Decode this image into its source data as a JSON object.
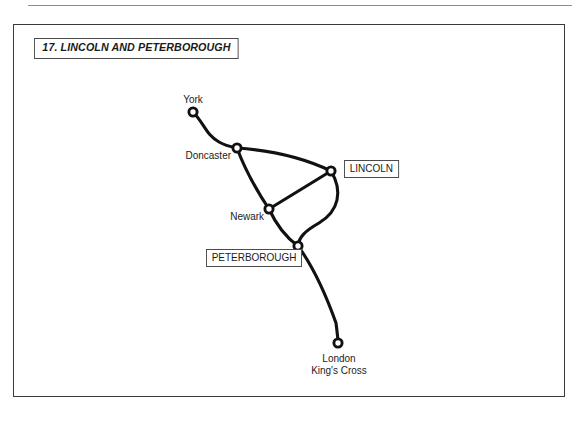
{
  "page": {
    "background_color": "#ffffff",
    "top_rule_color": "#8d8d8d"
  },
  "frame": {
    "border_color": "#3a3a3a",
    "title": "17. LINCOLN AND PETERBOROUGH"
  },
  "map": {
    "line_color": "#111111",
    "station_fill": "#ffffff",
    "stations": [
      {
        "id": "york",
        "label": "York",
        "x": 179,
        "y": 87,
        "highlighted": false
      },
      {
        "id": "doncaster",
        "label": "Doncaster",
        "x": 223,
        "y": 123,
        "highlighted": false
      },
      {
        "id": "lincoln",
        "label": "LINCOLN",
        "x": 317,
        "y": 146,
        "highlighted": true
      },
      {
        "id": "newark",
        "label": "Newark",
        "x": 255,
        "y": 184,
        "highlighted": false
      },
      {
        "id": "peterborough",
        "label": "PETERBOROUGH",
        "x": 284,
        "y": 221,
        "highlighted": true
      },
      {
        "id": "london",
        "label": "London King's Cross",
        "label_line_1": "London",
        "label_line_2": "King's Cross",
        "x": 324,
        "y": 318,
        "highlighted": false
      }
    ],
    "links": [
      {
        "from": "york",
        "to": "doncaster"
      },
      {
        "from": "doncaster",
        "to": "lincoln"
      },
      {
        "from": "doncaster",
        "to": "newark"
      },
      {
        "from": "newark",
        "to": "lincoln"
      },
      {
        "from": "newark",
        "to": "peterborough"
      },
      {
        "from": "lincoln",
        "to": "peterborough"
      },
      {
        "from": "peterborough",
        "to": "london"
      }
    ]
  }
}
